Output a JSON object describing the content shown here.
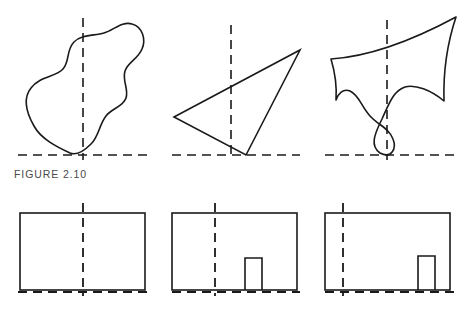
{
  "page": {
    "background_color": "#ffffff",
    "ink_color": "#1a1a1a",
    "caption_color": "#4a4a4a",
    "width": 471,
    "height": 318
  },
  "figures": [
    {
      "id": "figure-2-10",
      "caption": "FIGURE 2.10",
      "panels": [
        {
          "id": "panel-blob",
          "shape_name": "freeform-blob",
          "ground_line": {
            "x1": 18,
            "x2": 148,
            "y": 155
          },
          "axis_line": {
            "x": 83,
            "y1": 18,
            "y2": 160
          },
          "outline_path": "M 70 153 C 56 148 40 140 33 127 C 25 113 22 98 30 88 C 39 77 55 77 62 70 C 69 62 66 50 74 42 C 82 34 94 36 104 33 C 114 30 122 22 132 25 C 142 28 145 40 141 49 C 137 59 127 62 124 71 C 121 81 128 89 125 98 C 122 107 111 108 105 116 C 98 125 98 136 90 144 C 83 151 77 156 70 153 Z"
        },
        {
          "id": "panel-triangle",
          "shape_name": "triangle",
          "ground_line": {
            "x1": 172,
            "x2": 300,
            "y": 155
          },
          "axis_line": {
            "x": 231,
            "y1": 25,
            "y2": 160
          },
          "vertices": [
            [
              174,
              117
            ],
            [
              300,
              50
            ],
            [
              246,
              155
            ]
          ]
        },
        {
          "id": "panel-horn",
          "shape_name": "curved-horn-blob",
          "ground_line": {
            "x1": 325,
            "x2": 455,
            "y": 155
          },
          "axis_line": {
            "x": 387,
            "y1": 20,
            "y2": 160
          },
          "outline_path": "M 331 60 C 360 57 400 47 455 18 C 448 40 443 66 444 100 C 430 90 414 85 404 88 C 392 92 388 103 381 118 C 373 133 370 145 380 152 C 390 158 396 150 393 140 C 390 129 378 126 370 117 C 361 107 360 96 351 92 C 344 88 339 93 336 99 C 337 86 334 70 331 60 Z"
        }
      ]
    },
    {
      "id": "figure-2-11",
      "caption": "FIGURE 2.11",
      "panels": [
        {
          "id": "panel-rect-plain",
          "shape_name": "rectangle",
          "ground_line": {
            "x1": 18,
            "x2": 148,
            "y": 292
          },
          "axis_line": {
            "x": 83,
            "y1": 203,
            "y2": 296
          },
          "rect": {
            "x": 20,
            "y": 213,
            "width": 125,
            "height": 77
          },
          "door": null
        },
        {
          "id": "panel-rect-door-center",
          "shape_name": "rectangle-with-door",
          "ground_line": {
            "x1": 172,
            "x2": 300,
            "y": 292
          },
          "axis_line": {
            "x": 215,
            "y1": 203,
            "y2": 296
          },
          "rect": {
            "x": 172,
            "y": 213,
            "width": 125,
            "height": 77
          },
          "door": {
            "x": 245,
            "y": 258,
            "width": 17,
            "height": 32
          }
        },
        {
          "id": "panel-rect-door-right",
          "shape_name": "rectangle-with-door",
          "ground_line": {
            "x1": 325,
            "x2": 455,
            "y": 292
          },
          "axis_line": {
            "x": 343,
            "y1": 203,
            "y2": 296
          },
          "rect": {
            "x": 325,
            "y": 213,
            "width": 125,
            "height": 77
          },
          "door": {
            "x": 418,
            "y": 256,
            "width": 17,
            "height": 34
          }
        }
      ]
    }
  ]
}
